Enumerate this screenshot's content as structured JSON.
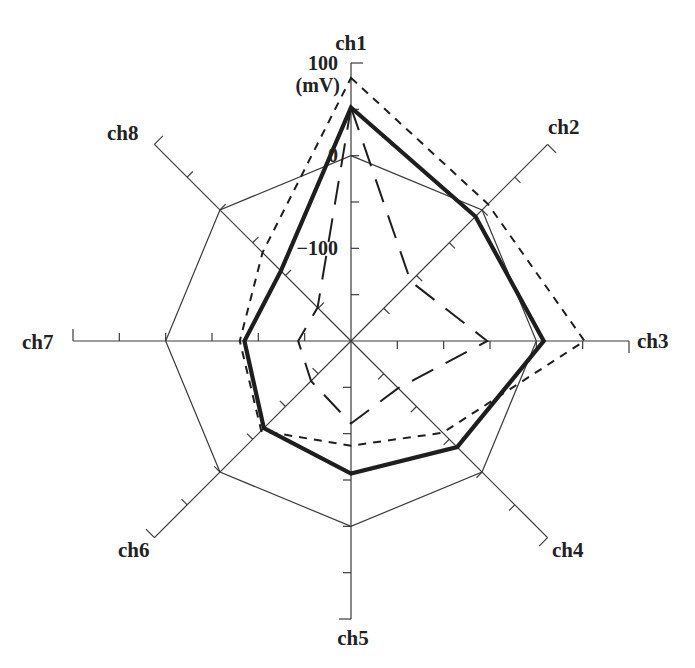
{
  "chart_data": {
    "type": "radar",
    "title": "",
    "unit_label": "(mV)",
    "axes": [
      "ch1",
      "ch2",
      "ch3",
      "ch4",
      "ch5",
      "ch6",
      "ch7",
      "ch8"
    ],
    "axis_range": [
      -200,
      100
    ],
    "tick_step": 50,
    "tick_labels": [
      "100",
      "0",
      "−100"
    ],
    "tick_label_values": [
      100,
      0,
      -100
    ],
    "grid": false,
    "legend": null,
    "reference_octagon_value": 0,
    "series": [
      {
        "name": "thick solid",
        "style": "solid-thick",
        "values": [
          52,
          -10,
          8,
          -38,
          -57,
          -67,
          -85,
          -93
        ]
      },
      {
        "name": "short dashed",
        "style": "dashed-short",
        "values": [
          84,
          9,
          52,
          -60,
          -87,
          -63,
          -80,
          -65
        ]
      },
      {
        "name": "long dashed",
        "style": "dashed-long",
        "values": [
          52,
          -109,
          -53,
          -128,
          -111,
          -139,
          -143,
          -149
        ]
      }
    ]
  },
  "colors": {
    "line": "#1e1e1e",
    "axis": "#3a3a3a",
    "background": "#ffffff"
  }
}
